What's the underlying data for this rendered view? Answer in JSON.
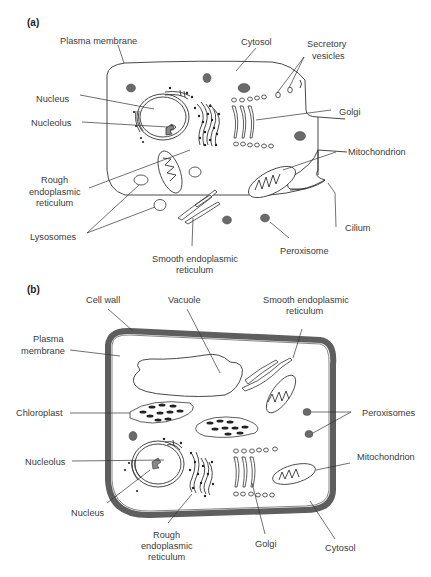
{
  "figure": {
    "panels": [
      {
        "id": "a",
        "panel_label": "(a)",
        "subject": "animal cell",
        "labels": {
          "plasma_membrane": "Plasma membrane",
          "cytosol": "Cytosol",
          "secretory_vesicles_1": "Secretory",
          "secretory_vesicles_2": "vesicles",
          "nucleus": "Nucleus",
          "nucleolus": "Nucleolus",
          "golgi": "Golgi",
          "mitochondrion": "Mitochondrion",
          "rough_er_1": "Rough",
          "rough_er_2": "endoplasmic",
          "rough_er_3": "reticulum",
          "lysosomes": "Lysosomes",
          "cilium": "Cilium",
          "smooth_er_1": "Smooth endoplasmic",
          "smooth_er_2": "reticulum",
          "peroxisome": "Peroxisome"
        }
      },
      {
        "id": "b",
        "panel_label": "(b)",
        "subject": "plant cell",
        "labels": {
          "cell_wall": "Cell wall",
          "vacuole": "Vacuole",
          "smooth_er_1": "Smooth endoplasmic",
          "smooth_er_2": "reticulum",
          "plasma_membrane_1": "Plasma",
          "plasma_membrane_2": "membrane",
          "chloroplast": "Chloroplast",
          "peroxisomes": "Peroxisomes",
          "nucleolus": "Nucleolus",
          "mitochondrion": "Mitochondrion",
          "nucleus": "Nucleus",
          "rough_er_1": "Rough",
          "rough_er_2": "endoplasmic",
          "rough_er_3": "reticulum",
          "golgi": "Golgi",
          "cytosol": "Cytosol"
        }
      }
    ],
    "colors": {
      "outline": "#333333",
      "organelle_fill": "#6a6a6a",
      "cell_wall": "#5e5e5e",
      "label_text": "#3a3a3a"
    }
  }
}
